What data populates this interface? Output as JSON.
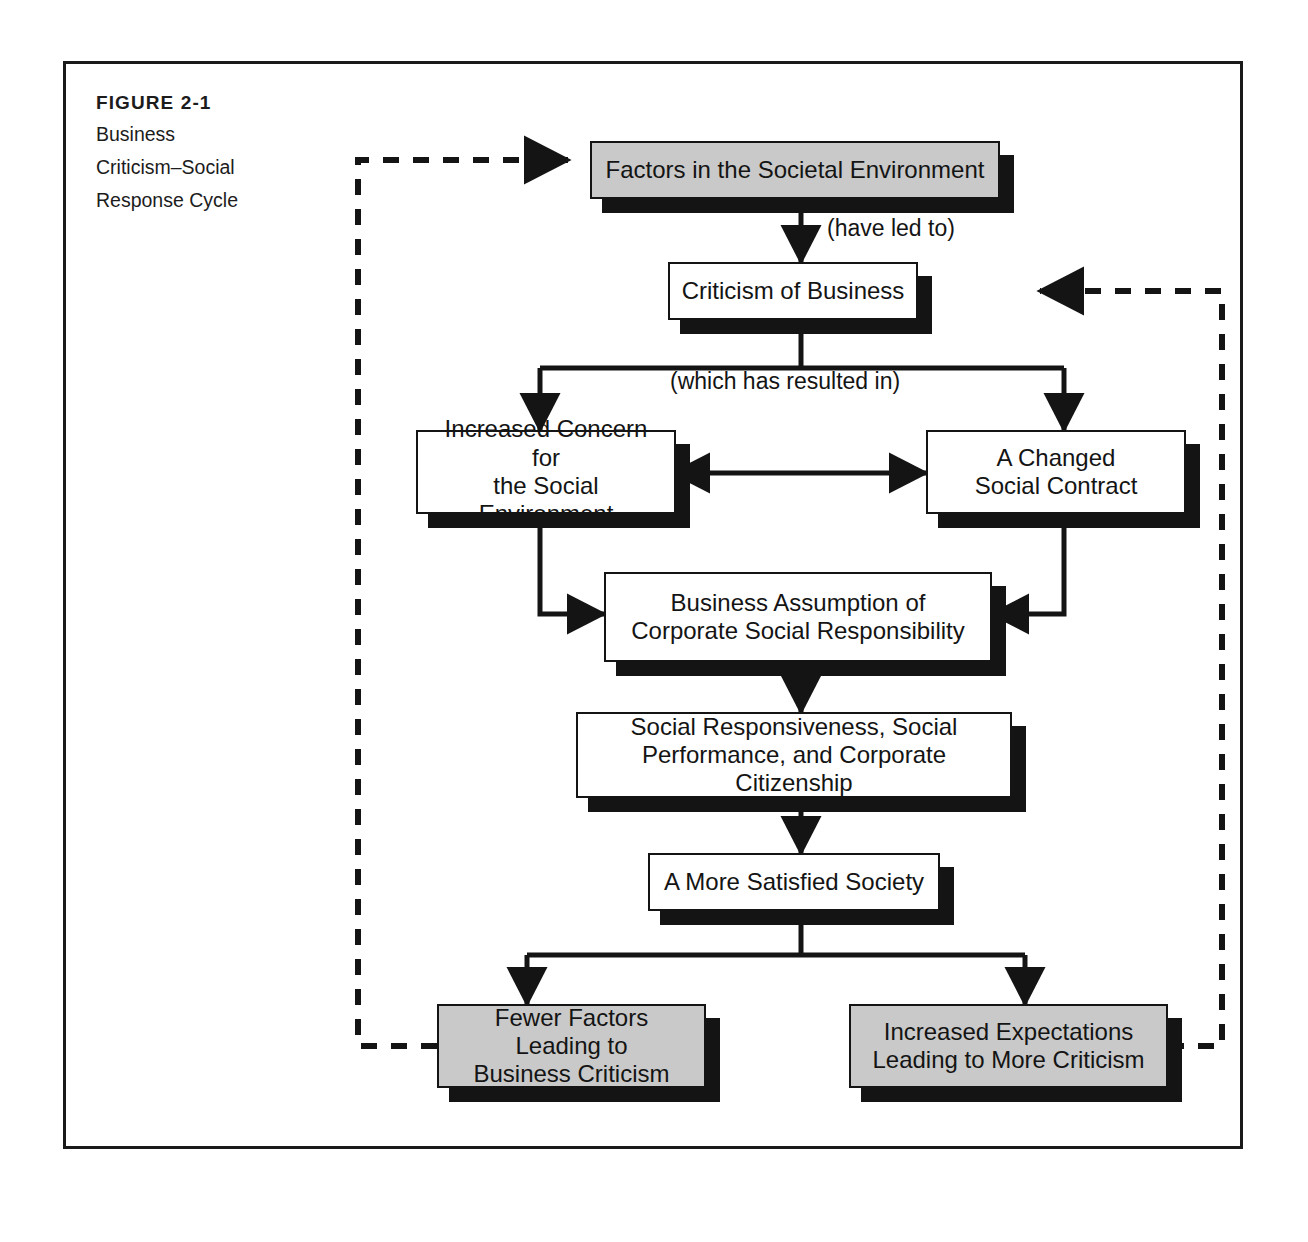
{
  "figure": {
    "number_label": "FIGURE 2-1",
    "title_lines": [
      "Business",
      "Criticism–Social",
      "Response Cycle"
    ]
  },
  "colors": {
    "ink": "#141414",
    "gray_fill": "#c9c9c9",
    "white_fill": "#ffffff",
    "frame": "#1a1a1a"
  },
  "diagram": {
    "type": "flowchart",
    "nodes": [
      {
        "id": "factors",
        "lines": [
          "Factors in the Societal Environment"
        ],
        "fill": "gray"
      },
      {
        "id": "criticism",
        "lines": [
          "Criticism of Business"
        ],
        "fill": "white"
      },
      {
        "id": "increased-concern",
        "lines": [
          "Increased Concern for",
          "the Social Environment"
        ],
        "fill": "white"
      },
      {
        "id": "changed-contract",
        "lines": [
          "A Changed",
          "Social Contract"
        ],
        "fill": "white"
      },
      {
        "id": "business-assumption",
        "lines": [
          "Business Assumption of",
          "Corporate Social Responsibility"
        ],
        "fill": "white"
      },
      {
        "id": "social-responsiveness",
        "lines": [
          "Social Responsiveness, Social",
          "Performance, and Corporate Citizenship"
        ],
        "fill": "white"
      },
      {
        "id": "satisfied-society",
        "lines": [
          "A More Satisfied Society"
        ],
        "fill": "white"
      },
      {
        "id": "fewer-factors",
        "lines": [
          "Fewer Factors Leading to",
          "Business Criticism"
        ],
        "fill": "gray"
      },
      {
        "id": "increased-expectations",
        "lines": [
          "Increased Expectations",
          "Leading to More Criticism"
        ],
        "fill": "gray"
      }
    ],
    "edge_labels": [
      {
        "id": "have-led-to",
        "text": "(have led to)"
      },
      {
        "id": "which-has-resulted-in",
        "text": "(which has resulted in)"
      }
    ],
    "edges": [
      {
        "from": "factors",
        "to": "criticism",
        "style": "solid",
        "label": "(have led to)"
      },
      {
        "from": "criticism",
        "to": "increased-concern",
        "style": "solid",
        "label": "(which has resulted in)"
      },
      {
        "from": "criticism",
        "to": "changed-contract",
        "style": "solid",
        "label": "(which has resulted in)"
      },
      {
        "from": "increased-concern",
        "to": "changed-contract",
        "style": "solid-bidirectional",
        "label": ""
      },
      {
        "from": "increased-concern",
        "to": "business-assumption",
        "style": "solid",
        "label": ""
      },
      {
        "from": "changed-contract",
        "to": "business-assumption",
        "style": "solid",
        "label": ""
      },
      {
        "from": "business-assumption",
        "to": "social-responsiveness",
        "style": "solid",
        "label": ""
      },
      {
        "from": "social-responsiveness",
        "to": "satisfied-society",
        "style": "solid",
        "label": ""
      },
      {
        "from": "satisfied-society",
        "to": "fewer-factors",
        "style": "solid",
        "label": ""
      },
      {
        "from": "satisfied-society",
        "to": "increased-expectations",
        "style": "solid",
        "label": ""
      },
      {
        "from": "fewer-factors",
        "to": "factors",
        "style": "dashed-feedback-left",
        "label": ""
      },
      {
        "from": "increased-expectations",
        "to": "criticism",
        "style": "dashed-feedback-right",
        "label": ""
      }
    ]
  }
}
